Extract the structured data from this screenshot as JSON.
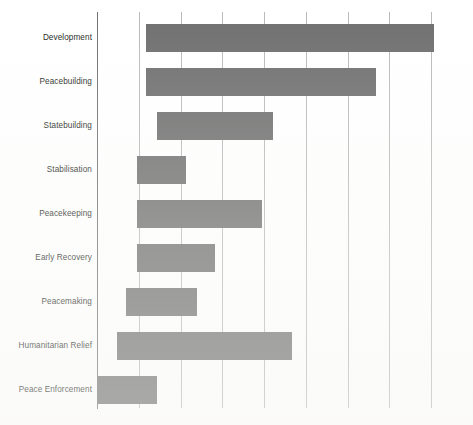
{
  "chart_data": {
    "type": "bar",
    "title": "",
    "subtitle": "",
    "xlabel": "",
    "ylabel": "",
    "orientation": "horizontal",
    "style": "gantt-range-bar",
    "grid": true,
    "grid_axis": "x",
    "legend": "none",
    "xlim": [
      0,
      9
    ],
    "xticks": [
      0,
      1,
      2,
      3,
      4,
      5,
      6,
      7,
      8,
      9
    ],
    "xtick_labels": [
      "",
      "",
      "",
      "",
      "",
      "",
      "",
      "",
      "",
      ""
    ],
    "bar_color": "#6e6e6e",
    "gridline_color": "#b9b9b9",
    "axis_color": "#6f6f6f",
    "background_color": "#ffffff",
    "categories": [
      "Development",
      "Peacebuilding",
      "Statebuilding",
      "Stabilisation",
      "Peacekeeping",
      "Early Recovery",
      "Peacemaking",
      "Humanitarian Relief",
      "Peace Enforcement"
    ],
    "bars": [
      {
        "label": "Development",
        "start": 1.18,
        "end": 8.08,
        "duration": 6.9
      },
      {
        "label": "Peacebuilding",
        "start": 1.18,
        "end": 6.69,
        "duration": 5.51
      },
      {
        "label": "Statebuilding",
        "start": 1.44,
        "end": 4.21,
        "duration": 2.77
      },
      {
        "label": "Stabilisation",
        "start": 0.95,
        "end": 2.13,
        "duration": 1.18
      },
      {
        "label": "Peacekeeping",
        "start": 0.95,
        "end": 3.95,
        "duration": 3.0
      },
      {
        "label": "Early Recovery",
        "start": 0.95,
        "end": 2.82,
        "duration": 1.87
      },
      {
        "label": "Peacemaking",
        "start": 0.69,
        "end": 2.38,
        "duration": 1.69
      },
      {
        "label": "Humanitarian Relief",
        "start": 0.49,
        "end": 4.69,
        "duration": 4.2
      },
      {
        "label": "Peace Enforcement",
        "start": 0.0,
        "end": 1.44,
        "duration": 1.44
      }
    ]
  },
  "axis_labels": {
    "0": "Development",
    "1": "Peacebuilding",
    "2": "Statebuilding",
    "3": "Stabilisation",
    "4": "Peacekeeping",
    "5": "Early Recovery",
    "6": "Peacemaking",
    "7": "Humanitarian Relief",
    "8": "Peace Enforcement"
  }
}
